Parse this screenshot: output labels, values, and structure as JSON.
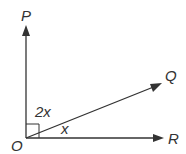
{
  "diagram": {
    "points": {
      "O": "O",
      "P": "P",
      "Q": "Q",
      "R": "R"
    },
    "angles": {
      "POQ": "2x",
      "QOR": "x"
    },
    "right_angle_marker": "POR",
    "color": "#333333"
  }
}
